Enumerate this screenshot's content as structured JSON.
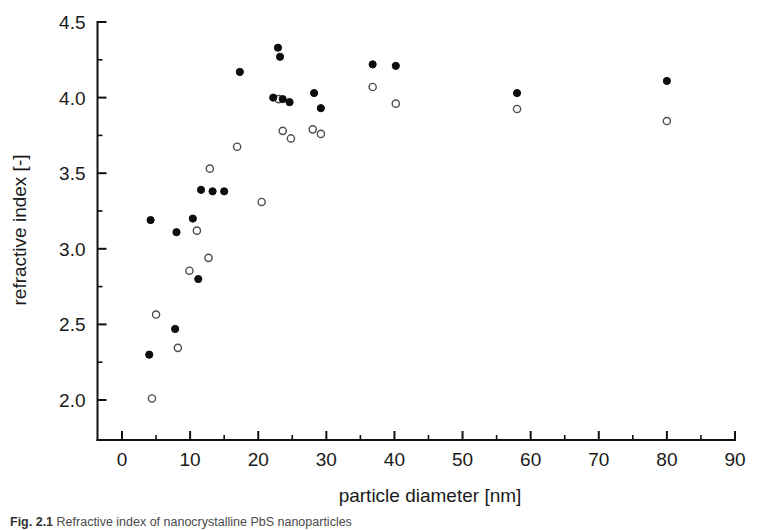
{
  "figure": {
    "background_color": "#ffffff",
    "caption_label": "Fig. 2.1",
    "caption_text": "Refractive index of nanocrystalline PbS nanoparticles"
  },
  "chart_data": {
    "type": "scatter",
    "title": "",
    "xlabel": "particle diameter  [nm]",
    "ylabel": "refractive index [-]",
    "xlim": [
      -5,
      92
    ],
    "ylim": [
      1.82,
      4.6
    ],
    "x_ticks": [
      0,
      10,
      20,
      30,
      40,
      50,
      60,
      70,
      80,
      90
    ],
    "x_tick_labels": [
      "0",
      "10",
      "20",
      "30",
      "40",
      "50",
      "60",
      "70",
      "80",
      "90"
    ],
    "x_minor_ticks": [
      5,
      15,
      25,
      35,
      45,
      55,
      65,
      75,
      85
    ],
    "y_ticks": [
      2.0,
      2.5,
      3.0,
      3.5,
      4.0,
      4.5
    ],
    "y_tick_labels": [
      "2.0",
      "2.5",
      "3.0",
      "3.5",
      "4.0",
      "4.5"
    ],
    "y_minor_ticks": [
      2.25,
      2.75,
      3.25,
      3.75,
      4.25
    ],
    "grid": false,
    "legend": false,
    "legend_position": "none",
    "marker_size": 6,
    "series": [
      {
        "name": "filled",
        "marker": "filled-circle",
        "color": "#0d0d0d",
        "points": [
          [
            4.0,
            2.3
          ],
          [
            4.2,
            3.19
          ],
          [
            7.8,
            2.47
          ],
          [
            8.0,
            3.11
          ],
          [
            10.4,
            3.2
          ],
          [
            11.2,
            2.8
          ],
          [
            11.6,
            3.39
          ],
          [
            13.3,
            3.38
          ],
          [
            15.0,
            3.38
          ],
          [
            17.3,
            4.17
          ],
          [
            22.2,
            4.0
          ],
          [
            22.9,
            4.33
          ],
          [
            23.2,
            4.27
          ],
          [
            23.6,
            3.99
          ],
          [
            24.6,
            3.97
          ],
          [
            28.2,
            4.03
          ],
          [
            29.2,
            3.93
          ],
          [
            36.8,
            4.22
          ],
          [
            40.2,
            4.21
          ],
          [
            58.0,
            4.03
          ],
          [
            80.0,
            4.11
          ]
        ]
      },
      {
        "name": "open",
        "marker": "open-circle",
        "color": "#4d4d4d",
        "points": [
          [
            4.4,
            2.01
          ],
          [
            5.0,
            2.565
          ],
          [
            8.2,
            2.345
          ],
          [
            9.9,
            2.855
          ],
          [
            11.0,
            3.12
          ],
          [
            12.7,
            2.94
          ],
          [
            12.9,
            3.53
          ],
          [
            16.9,
            3.675
          ],
          [
            20.5,
            3.31
          ],
          [
            23.0,
            3.99
          ],
          [
            23.6,
            3.78
          ],
          [
            24.8,
            3.73
          ],
          [
            28.0,
            3.79
          ],
          [
            29.2,
            3.76
          ],
          [
            36.8,
            4.07
          ],
          [
            40.2,
            3.96
          ],
          [
            58.0,
            3.925
          ],
          [
            80.0,
            3.845
          ]
        ]
      }
    ]
  }
}
